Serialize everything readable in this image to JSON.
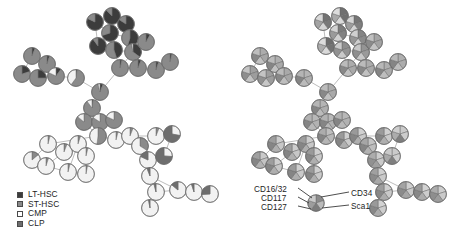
{
  "figure": {
    "title": "",
    "panels": [
      {
        "id": "left",
        "name": "cell-type-composition-tree"
      },
      {
        "id": "right",
        "name": "marker-expression-tree"
      }
    ]
  },
  "legend": {
    "name": "cell-type-legend",
    "items": [
      {
        "label": "LT-HSC",
        "color": "#3c3c3c"
      },
      {
        "label": "ST-HSC",
        "color": "#8a8a8a"
      },
      {
        "label": "CMP",
        "color": "#ffffff"
      },
      {
        "label": "CLP",
        "color": "#6e6e6e"
      }
    ]
  },
  "marker_key": {
    "name": "marker-key",
    "left_labels": [
      "CD16/32",
      "CD117",
      "CD127"
    ],
    "right_labels": [
      "CD34",
      "Sca1"
    ],
    "wedge_order": [
      "CD34",
      "Sca1",
      "CD127",
      "CD117",
      "CD16/32"
    ]
  },
  "colors": {
    "lt_hsc": "#3c3c3c",
    "st_hsc": "#8a8a8a",
    "cmp": "#f2f2f2",
    "clp": "#6e6e6e",
    "node_outline": "#6b6b6b",
    "edge": "#bdbdbd",
    "text": "#1d1d1d",
    "marker_high": "#5e5e5e",
    "marker_mid": "#9a9a9a",
    "marker_low": "#d8d8d8"
  },
  "chart_data": {
    "type": "pie",
    "title": "",
    "xlabel": "",
    "ylabel": "",
    "categories_left": [
      "LT-HSC",
      "ST-HSC",
      "CMP",
      "CLP"
    ],
    "categories_right": [
      "CD34",
      "Sca1",
      "CD127",
      "CD117",
      "CD16/32"
    ],
    "node_radius": 8.2,
    "nodes": [
      {
        "id": 0,
        "x": 95,
        "y": 22,
        "r": 8.4,
        "composition": [
          0.82,
          0.18,
          0.0,
          0.0
        ],
        "markers": [
          0.78,
          0.74,
          0.12,
          0.46,
          0.1
        ]
      },
      {
        "id": 1,
        "x": 112,
        "y": 16,
        "r": 8.4,
        "composition": [
          0.88,
          0.12,
          0.0,
          0.0
        ],
        "markers": [
          0.8,
          0.8,
          0.1,
          0.42,
          0.08
        ]
      },
      {
        "id": 2,
        "x": 126,
        "y": 24,
        "r": 8.4,
        "composition": [
          0.84,
          0.16,
          0.0,
          0.0
        ],
        "markers": [
          0.76,
          0.7,
          0.14,
          0.5,
          0.12
        ]
      },
      {
        "id": 3,
        "x": 110,
        "y": 33,
        "r": 8.4,
        "composition": [
          0.7,
          0.3,
          0.0,
          0.0
        ],
        "markers": [
          0.72,
          0.68,
          0.16,
          0.52,
          0.14
        ]
      },
      {
        "id": 4,
        "x": 130,
        "y": 38,
        "r": 8.4,
        "composition": [
          0.55,
          0.45,
          0.0,
          0.0
        ],
        "markers": [
          0.66,
          0.62,
          0.18,
          0.55,
          0.16
        ]
      },
      {
        "id": 5,
        "x": 98,
        "y": 46,
        "r": 8.4,
        "composition": [
          0.9,
          0.1,
          0.0,
          0.0
        ],
        "markers": [
          0.82,
          0.78,
          0.1,
          0.4,
          0.08
        ]
      },
      {
        "id": 6,
        "x": 114,
        "y": 50,
        "r": 8.4,
        "composition": [
          0.45,
          0.55,
          0.0,
          0.0
        ],
        "markers": [
          0.6,
          0.56,
          0.2,
          0.58,
          0.2
        ]
      },
      {
        "id": 7,
        "x": 133,
        "y": 52,
        "r": 8.4,
        "composition": [
          0.35,
          0.62,
          0.03,
          0.0
        ],
        "markers": [
          0.56,
          0.52,
          0.22,
          0.6,
          0.22
        ]
      },
      {
        "id": 8,
        "x": 146,
        "y": 42,
        "r": 8.4,
        "composition": [
          0.08,
          0.92,
          0.0,
          0.0
        ],
        "markers": [
          0.44,
          0.46,
          0.24,
          0.62,
          0.26
        ]
      },
      {
        "id": 9,
        "x": 32,
        "y": 56,
        "r": 8.4,
        "composition": [
          0.06,
          0.94,
          0.0,
          0.0
        ],
        "markers": [
          0.4,
          0.44,
          0.26,
          0.64,
          0.28
        ]
      },
      {
        "id": 10,
        "x": 47,
        "y": 64,
        "r": 8.4,
        "composition": [
          0.05,
          0.95,
          0.0,
          0.0
        ],
        "markers": [
          0.38,
          0.42,
          0.26,
          0.66,
          0.3
        ]
      },
      {
        "id": 11,
        "x": 22,
        "y": 74,
        "r": 8.4,
        "composition": [
          0.2,
          0.8,
          0.0,
          0.0
        ],
        "markers": [
          0.48,
          0.5,
          0.24,
          0.6,
          0.24
        ]
      },
      {
        "id": 12,
        "x": 38,
        "y": 78,
        "r": 8.4,
        "composition": [
          0.25,
          0.75,
          0.0,
          0.0
        ],
        "markers": [
          0.5,
          0.5,
          0.22,
          0.58,
          0.24
        ]
      },
      {
        "id": 13,
        "x": 56,
        "y": 76,
        "r": 8.4,
        "composition": [
          0.1,
          0.72,
          0.18,
          0.0
        ],
        "markers": [
          0.42,
          0.44,
          0.28,
          0.64,
          0.3
        ]
      },
      {
        "id": 14,
        "x": 76,
        "y": 78,
        "r": 8.4,
        "composition": [
          0.02,
          0.58,
          0.4,
          0.0
        ],
        "markers": [
          0.34,
          0.38,
          0.3,
          0.66,
          0.34
        ]
      },
      {
        "id": 15,
        "x": 120,
        "y": 68,
        "r": 8.4,
        "composition": [
          0.04,
          0.96,
          0.0,
          0.0
        ],
        "markers": [
          0.4,
          0.42,
          0.26,
          0.64,
          0.3
        ]
      },
      {
        "id": 16,
        "x": 138,
        "y": 68,
        "r": 8.4,
        "composition": [
          0.06,
          0.94,
          0.0,
          0.0
        ],
        "markers": [
          0.4,
          0.42,
          0.26,
          0.64,
          0.3
        ]
      },
      {
        "id": 17,
        "x": 156,
        "y": 70,
        "r": 8.4,
        "composition": [
          0.05,
          0.95,
          0.0,
          0.0
        ],
        "markers": [
          0.38,
          0.4,
          0.28,
          0.66,
          0.32
        ]
      },
      {
        "id": 18,
        "x": 170,
        "y": 62,
        "r": 8.4,
        "composition": [
          0.04,
          0.96,
          0.0,
          0.0
        ],
        "markers": [
          0.38,
          0.4,
          0.28,
          0.66,
          0.32
        ]
      },
      {
        "id": 19,
        "x": 100,
        "y": 92,
        "r": 8.4,
        "composition": [
          0.06,
          0.9,
          0.04,
          0.0
        ],
        "markers": [
          0.4,
          0.42,
          0.26,
          0.64,
          0.3
        ]
      },
      {
        "id": 20,
        "x": 92,
        "y": 108,
        "r": 8.4,
        "composition": [
          0.02,
          0.88,
          0.1,
          0.0
        ],
        "markers": [
          0.34,
          0.38,
          0.3,
          0.66,
          0.34
        ]
      },
      {
        "id": 21,
        "x": 84,
        "y": 122,
        "r": 8.4,
        "composition": [
          0.0,
          0.86,
          0.14,
          0.0
        ],
        "markers": [
          0.32,
          0.36,
          0.32,
          0.66,
          0.36
        ]
      },
      {
        "id": 22,
        "x": 100,
        "y": 122,
        "r": 8.4,
        "composition": [
          0.0,
          0.84,
          0.16,
          0.0
        ],
        "markers": [
          0.32,
          0.36,
          0.32,
          0.66,
          0.36
        ]
      },
      {
        "id": 23,
        "x": 114,
        "y": 120,
        "r": 8.4,
        "composition": [
          0.0,
          0.82,
          0.18,
          0.0
        ],
        "markers": [
          0.32,
          0.36,
          0.32,
          0.66,
          0.36
        ]
      },
      {
        "id": 24,
        "x": 98,
        "y": 136,
        "r": 8.4,
        "composition": [
          0.0,
          0.52,
          0.48,
          0.0
        ],
        "markers": [
          0.28,
          0.32,
          0.34,
          0.66,
          0.4
        ]
      },
      {
        "id": 25,
        "x": 48,
        "y": 144,
        "r": 8.4,
        "composition": [
          0.0,
          0.04,
          0.96,
          0.0
        ],
        "markers": [
          0.18,
          0.22,
          0.38,
          0.66,
          0.5
        ]
      },
      {
        "id": 26,
        "x": 64,
        "y": 152,
        "r": 8.4,
        "composition": [
          0.0,
          0.06,
          0.94,
          0.0
        ],
        "markers": [
          0.18,
          0.22,
          0.38,
          0.66,
          0.5
        ]
      },
      {
        "id": 27,
        "x": 78,
        "y": 144,
        "r": 8.4,
        "composition": [
          0.0,
          0.05,
          0.95,
          0.0
        ],
        "markers": [
          0.18,
          0.22,
          0.38,
          0.66,
          0.5
        ]
      },
      {
        "id": 28,
        "x": 86,
        "y": 156,
        "r": 8.4,
        "composition": [
          0.0,
          0.04,
          0.96,
          0.0
        ],
        "markers": [
          0.16,
          0.2,
          0.38,
          0.66,
          0.52
        ]
      },
      {
        "id": 29,
        "x": 32,
        "y": 160,
        "r": 8.4,
        "composition": [
          0.0,
          0.14,
          0.86,
          0.0
        ],
        "markers": [
          0.2,
          0.24,
          0.36,
          0.66,
          0.48
        ]
      },
      {
        "id": 30,
        "x": 46,
        "y": 166,
        "r": 8.4,
        "composition": [
          0.0,
          0.05,
          0.95,
          0.0
        ],
        "markers": [
          0.18,
          0.22,
          0.38,
          0.66,
          0.5
        ]
      },
      {
        "id": 31,
        "x": 68,
        "y": 172,
        "r": 8.4,
        "composition": [
          0.0,
          0.04,
          0.96,
          0.0
        ],
        "markers": [
          0.16,
          0.2,
          0.38,
          0.66,
          0.52
        ]
      },
      {
        "id": 32,
        "x": 86,
        "y": 174,
        "r": 8.4,
        "composition": [
          0.0,
          0.03,
          0.97,
          0.0
        ],
        "markers": [
          0.16,
          0.2,
          0.38,
          0.66,
          0.52
        ]
      },
      {
        "id": 33,
        "x": 116,
        "y": 140,
        "r": 8.4,
        "composition": [
          0.0,
          0.04,
          0.96,
          0.0
        ],
        "markers": [
          0.16,
          0.2,
          0.38,
          0.66,
          0.52
        ]
      },
      {
        "id": 34,
        "x": 130,
        "y": 136,
        "r": 8.4,
        "composition": [
          0.0,
          0.06,
          0.94,
          0.0
        ],
        "markers": [
          0.16,
          0.2,
          0.38,
          0.66,
          0.52
        ]
      },
      {
        "id": 35,
        "x": 140,
        "y": 146,
        "r": 8.4,
        "composition": [
          0.0,
          0.34,
          0.66,
          0.0
        ],
        "markers": [
          0.24,
          0.28,
          0.36,
          0.66,
          0.44
        ]
      },
      {
        "id": 36,
        "x": 156,
        "y": 136,
        "r": 8.4,
        "composition": [
          0.0,
          0.06,
          0.94,
          0.0
        ],
        "markers": [
          0.16,
          0.2,
          0.38,
          0.66,
          0.52
        ]
      },
      {
        "id": 37,
        "x": 172,
        "y": 134,
        "r": 8.4,
        "composition": [
          0.0,
          0.0,
          0.28,
          0.72
        ],
        "markers": [
          0.2,
          0.18,
          0.7,
          0.4,
          0.18
        ]
      },
      {
        "id": 38,
        "x": 148,
        "y": 160,
        "r": 8.4,
        "composition": [
          0.0,
          0.0,
          0.82,
          0.18
        ],
        "markers": [
          0.18,
          0.2,
          0.48,
          0.58,
          0.4
        ]
      },
      {
        "id": 39,
        "x": 164,
        "y": 156,
        "r": 8.4,
        "composition": [
          0.0,
          0.0,
          0.26,
          0.74
        ],
        "markers": [
          0.2,
          0.18,
          0.7,
          0.42,
          0.2
        ]
      },
      {
        "id": 40,
        "x": 150,
        "y": 176,
        "r": 8.4,
        "composition": [
          0.0,
          0.0,
          0.94,
          0.06
        ],
        "markers": [
          0.16,
          0.2,
          0.42,
          0.62,
          0.48
        ]
      },
      {
        "id": 41,
        "x": 156,
        "y": 192,
        "r": 8.4,
        "composition": [
          0.0,
          0.0,
          0.96,
          0.04
        ],
        "markers": [
          0.16,
          0.2,
          0.4,
          0.64,
          0.5
        ]
      },
      {
        "id": 42,
        "x": 150,
        "y": 208,
        "r": 8.4,
        "composition": [
          0.0,
          0.0,
          0.97,
          0.03
        ],
        "markers": [
          0.14,
          0.18,
          0.4,
          0.64,
          0.52
        ]
      },
      {
        "id": 43,
        "x": 178,
        "y": 190,
        "r": 8.4,
        "composition": [
          0.0,
          0.0,
          0.86,
          0.14
        ],
        "markers": [
          0.16,
          0.2,
          0.44,
          0.62,
          0.46
        ]
      },
      {
        "id": 44,
        "x": 194,
        "y": 192,
        "r": 8.4,
        "composition": [
          0.0,
          0.0,
          0.95,
          0.05
        ],
        "markers": [
          0.14,
          0.18,
          0.4,
          0.64,
          0.52
        ]
      },
      {
        "id": 45,
        "x": 210,
        "y": 194,
        "r": 8.4,
        "composition": [
          0.0,
          0.0,
          0.74,
          0.26
        ],
        "markers": [
          0.18,
          0.2,
          0.5,
          0.6,
          0.4
        ]
      }
    ],
    "edges": [
      [
        0,
        1
      ],
      [
        1,
        2
      ],
      [
        0,
        3
      ],
      [
        3,
        2
      ],
      [
        3,
        4
      ],
      [
        2,
        4
      ],
      [
        0,
        5
      ],
      [
        3,
        5
      ],
      [
        5,
        6
      ],
      [
        3,
        6
      ],
      [
        6,
        7
      ],
      [
        4,
        7
      ],
      [
        7,
        8
      ],
      [
        4,
        8
      ],
      [
        9,
        10
      ],
      [
        9,
        11
      ],
      [
        11,
        12
      ],
      [
        10,
        12
      ],
      [
        12,
        13
      ],
      [
        13,
        14
      ],
      [
        14,
        19
      ],
      [
        10,
        13
      ],
      [
        6,
        15
      ],
      [
        15,
        16
      ],
      [
        16,
        17
      ],
      [
        17,
        18
      ],
      [
        7,
        15
      ],
      [
        15,
        19
      ],
      [
        19,
        20
      ],
      [
        20,
        21
      ],
      [
        21,
        22
      ],
      [
        22,
        23
      ],
      [
        20,
        22
      ],
      [
        22,
        24
      ],
      [
        24,
        21
      ],
      [
        24,
        25
      ],
      [
        25,
        26
      ],
      [
        26,
        27
      ],
      [
        27,
        28
      ],
      [
        25,
        29
      ],
      [
        29,
        30
      ],
      [
        30,
        31
      ],
      [
        31,
        32
      ],
      [
        28,
        32
      ],
      [
        27,
        31
      ],
      [
        26,
        30
      ],
      [
        24,
        33
      ],
      [
        33,
        34
      ],
      [
        34,
        35
      ],
      [
        35,
        36
      ],
      [
        36,
        37
      ],
      [
        34,
        36
      ],
      [
        35,
        38
      ],
      [
        38,
        39
      ],
      [
        39,
        37
      ],
      [
        38,
        40
      ],
      [
        40,
        41
      ],
      [
        41,
        42
      ],
      [
        40,
        43
      ],
      [
        43,
        44
      ],
      [
        44,
        45
      ],
      [
        41,
        43
      ]
    ]
  }
}
